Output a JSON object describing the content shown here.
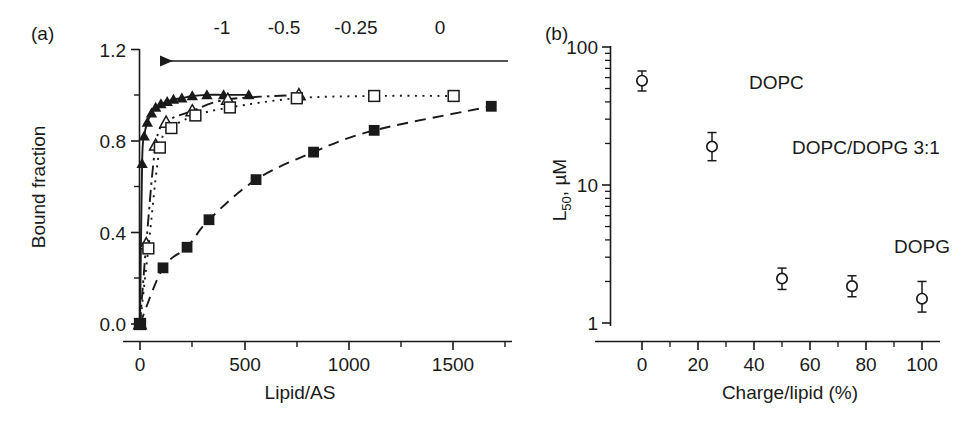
{
  "figure": {
    "background": "#ffffff",
    "ink": "#1a1a1a"
  },
  "panel_a": {
    "label": "(a)",
    "xlabel": "Lipid/AS",
    "ylabel": "Bound fraction",
    "x_ticks": [
      "0",
      "500",
      "1000",
      "1500"
    ],
    "x_tick_values": [
      0,
      500,
      1000,
      1500
    ],
    "y_ticks": [
      "0.0",
      "0.4",
      "0.8",
      "1.2"
    ],
    "y_tick_values": [
      0.0,
      0.4,
      0.8,
      1.2
    ],
    "xlim": [
      -40,
      1760
    ],
    "ylim": [
      -0.04,
      1.2
    ],
    "top_axis": {
      "labels": [
        "-1",
        "-0.5",
        "-0.25",
        "0"
      ],
      "label_x_positions": [
        222,
        282,
        352,
        437
      ],
      "arrow_direction": "left",
      "arrow_from_x": 508,
      "arrow_to_x": 158,
      "arrow_y": 61
    }
  },
  "panel_b": {
    "label": "(b)",
    "xlabel": "Charge/lipid (%)",
    "ylabel_main": "L",
    "ylabel_sub": "50",
    "ylabel_unit": ", µM",
    "x_ticks": [
      "0",
      "20",
      "40",
      "60",
      "80",
      "100"
    ],
    "x_tick_values": [
      0,
      20,
      40,
      60,
      80,
      100
    ],
    "y_ticks": [
      "1",
      "10",
      "100"
    ],
    "y_tick_values": [
      1,
      10,
      100
    ],
    "xlim": [
      -12,
      112
    ],
    "ylim": [
      0.82,
      100
    ],
    "y_scale": "log",
    "annotations": [
      {
        "text": "DOPC",
        "x": 48,
        "y": 56
      },
      {
        "text": "DOPC/DOPG 3:1",
        "x": 80,
        "y": 19
      },
      {
        "text": "DOPG",
        "x": 100,
        "y": 3.6
      }
    ]
  },
  "chart_data": [
    {
      "type": "line",
      "id": "panel-a",
      "title": "(a)",
      "xlabel": "Lipid/AS",
      "ylabel": "Bound fraction",
      "xlim": [
        -40,
        1760
      ],
      "ylim": [
        -0.04,
        1.2
      ],
      "grid": false,
      "legend": "none",
      "top_axis_label": "Surface charge density",
      "top_axis_ticks": [
        -1,
        -0.5,
        -0.25,
        0
      ],
      "series": [
        {
          "name": "filled-triangle",
          "marker": "filled-triangle",
          "line": "solid",
          "x": [
            0,
            10,
            20,
            35,
            55,
            75,
            100,
            130,
            160,
            200,
            250,
            320,
            400,
            520
          ],
          "y": [
            0.0,
            0.7,
            0.82,
            0.88,
            0.92,
            0.945,
            0.96,
            0.97,
            0.98,
            0.985,
            0.995,
            1.0,
            1.0,
            1.0
          ]
        },
        {
          "name": "open-triangle",
          "marker": "open-triangle",
          "line": "dash-dot",
          "x": [
            0,
            30,
            75,
            125,
            250,
            420,
            760
          ],
          "y": [
            0.0,
            0.35,
            0.78,
            0.88,
            0.93,
            0.98,
            1.0
          ]
        },
        {
          "name": "open-square",
          "marker": "open-square",
          "line": "dotted",
          "x": [
            0,
            40,
            95,
            150,
            265,
            430,
            750,
            1120,
            1500
          ],
          "y": [
            0.0,
            0.33,
            0.77,
            0.855,
            0.91,
            0.945,
            0.985,
            0.995,
            0.995
          ]
        },
        {
          "name": "filled-square",
          "marker": "filled-square",
          "line": "dashed",
          "x": [
            0,
            110,
            225,
            330,
            555,
            830,
            1120,
            1680
          ],
          "y": [
            0.0,
            0.245,
            0.335,
            0.455,
            0.63,
            0.75,
            0.845,
            0.95
          ]
        }
      ]
    },
    {
      "type": "scatter",
      "id": "panel-b",
      "title": "(b)",
      "xlabel": "Charge/lipid (%)",
      "ylabel": "L50, µM",
      "xlim": [
        -12,
        112
      ],
      "ylim": [
        0.82,
        100
      ],
      "yscale": "log",
      "grid": false,
      "legend": "none",
      "marker": "open-circle-with-errorbars",
      "x": [
        0,
        25,
        50,
        75,
        100
      ],
      "y": [
        57,
        19,
        2.1,
        1.85,
        1.5
      ],
      "yerr_low": [
        9,
        4,
        0.35,
        0.3,
        0.3
      ],
      "yerr_high": [
        10,
        5,
        0.4,
        0.35,
        0.5
      ],
      "point_labels": [
        "DOPC",
        "DOPC/DOPG 3:1",
        "",
        "",
        "DOPG"
      ]
    }
  ]
}
